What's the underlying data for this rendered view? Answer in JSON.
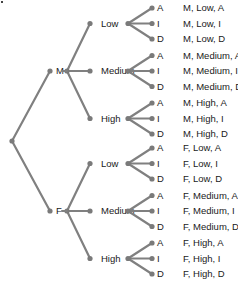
{
  "diagram": {
    "type": "tree",
    "root": "",
    "levels": [
      "Gender",
      "Level",
      "Response"
    ],
    "gender": [
      {
        "label": "M"
      },
      {
        "label": "F"
      }
    ],
    "level": [
      "Low",
      "Medium",
      "High"
    ],
    "response": [
      "A",
      "I",
      "D"
    ],
    "outcomes": [
      "M, Low, A",
      "M, Low, I",
      "M, Low, D",
      "M, Medium, A",
      "M, Medium, I",
      "M, Medium, D",
      "M, High, A",
      "M, High, I",
      "M, High, D",
      "F, Low, A",
      "F, Low, I",
      "F, Low, D",
      "F, Medium, A",
      "F, Medium, I",
      "F, Medium, D",
      "F, High, A",
      "F, High, I",
      "F, High, D"
    ]
  },
  "colors": {
    "edge": "#808080",
    "node": "#7a7a7a",
    "text": "#1a1a1a"
  }
}
